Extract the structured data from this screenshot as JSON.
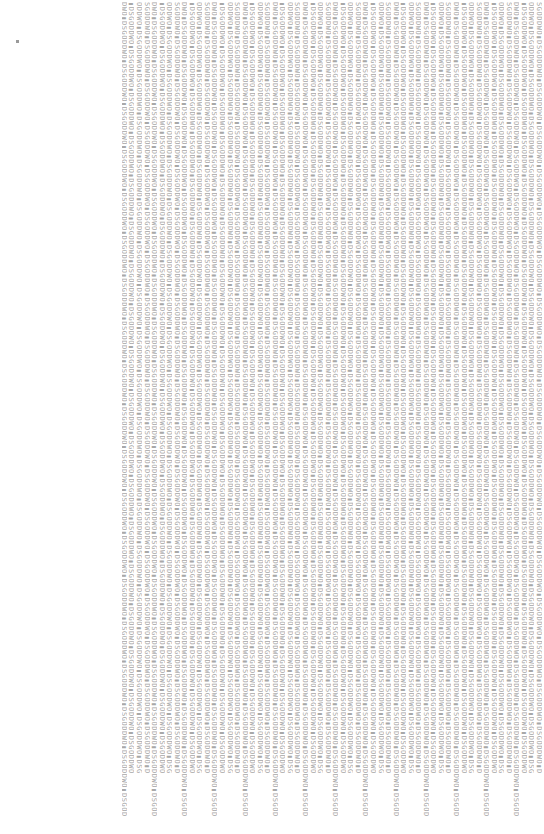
{
  "page": {
    "background": "#ffffff",
    "text_color": "#a8a8a8"
  },
  "text_block": {
    "column_count": 56,
    "patterns": [
      "DWO▮DSGODDWO▮DSGODDWO▮DSGODDWO▮DSGODDWO▮DSGODDWO▮DSGODDWO▮DSGODDWO▮DSGODDWO▮DSGODDWO▮DSGODDWO▮DSGODDWO▮DSGODDWO▮DSGODDWO▮DSGODDWO▮DSGODDWO▮DSGODDWO▮DSGODDWO▮DSGODDWO▮DSGOD",
      "▮DSGODDWO▮DSGODDWO▮DSGODDWO▮DSGODDWO▮DSGODDWO▮DSGODDWO▮DSGODDWO▮DSGODDWO▮DSGODDWO▮DSGODDWO▮DSGODDWO▮DSGODDWO▮DSGODDWO▮DSGODDWO▮DSGODDWO▮DSGODDWO▮DSGODDWO▮DSGODDWO",
      "ODDWO▮DSGODDWO▮DSGODDWO▮DSGODDWO▮DSGODDWO▮DSGODDWO▮DSGODDWO▮DSGODDWO▮DSGODDWO▮DSGODDWO▮DSGODDWO▮DSGODDWO▮DSGODDWO▮DSGODDWO▮DSGODDWO▮DSGODDWO▮DSGODDWO▮DSGODDWO▮DSG",
      "SGODDWO▮DSGODDWO▮DSGODDWO▮DSGODDWO▮DSGODDWO▮DSGODDWO▮DSGODDWO▮DSGODDWO▮DSGODDWO▮DSGODDWO▮DSGODDWO▮DSGODDWO▮DSGODDWO▮DSGODDWO▮DSGODDWO▮DSGODDWO▮DSGODDWO▮DSGODDWO▮D"
    ]
  }
}
